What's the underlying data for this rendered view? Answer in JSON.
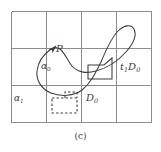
{
  "figure": {
    "caption": "(c)",
    "type": "mathematical-diagram",
    "background_color": "#ffffff",
    "grid": {
      "columns": 4,
      "rows": 3,
      "line_color": "#8c8c8c",
      "x_lines": [
        11,
        46,
        81,
        116,
        152
      ],
      "y_lines": [
        11,
        48,
        85,
        122
      ]
    },
    "curve": {
      "name": "alpha-0-loop",
      "color": "#3c3c3c",
      "closed": true,
      "description": "figure-eight style closed loop with basepoint P and orientation arrow"
    },
    "marked_point": {
      "name": "P",
      "x": 51,
      "y": 49
    },
    "solid_rectangle": {
      "name": "D0-translate-box",
      "x": 88,
      "y": 62,
      "width": 24,
      "height": 17,
      "color": "#3c3c3c"
    },
    "dashed_rectangle": {
      "name": "D0-box",
      "x": 52,
      "y": 98,
      "width": 25,
      "height": 15,
      "color": "#3c3c3c"
    },
    "labels": {
      "point_p": "P",
      "alpha_zero_base": "α",
      "alpha_zero_sub": "0",
      "alpha_one_base": "α",
      "alpha_one_sub": "1",
      "d_zero_base": "D",
      "d_zero_sub": "0",
      "t_d_zero_base_t": "t",
      "t_d_zero_sub_t": "1",
      "t_d_zero_base_d": "D",
      "t_d_zero_sub_d": "0"
    }
  }
}
